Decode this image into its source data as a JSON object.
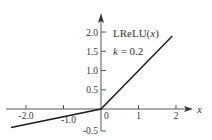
{
  "chart_data": {
    "type": "line",
    "title": "",
    "xlabel": "x",
    "ylabel": "",
    "annotations": [
      "LReLU(x)",
      "k = 0.2"
    ],
    "function": "LReLU(x) = x for x >= 0, k*x for x < 0",
    "k": 0.2,
    "x_ticks": [
      -2.0,
      -1.0,
      0,
      1,
      2
    ],
    "x_tick_labels": [
      "-2.0",
      "-1.0",
      "0",
      "1",
      "2"
    ],
    "y_ticks": [
      -0.5,
      0.5,
      1.0,
      1.5,
      2.0
    ],
    "y_tick_labels": [
      "-0.5",
      "0.5",
      "1.0",
      "1.5",
      "2.0"
    ],
    "xlim": [
      -2.4,
      2.4
    ],
    "ylim": [
      -0.6,
      2.3
    ],
    "grid": false,
    "legend": null,
    "series": [
      {
        "name": "LReLU(x)",
        "x": [
          -2.4,
          0,
          1.9
        ],
        "y": [
          -0.48,
          0,
          1.9
        ],
        "color": "#1a1a1a"
      }
    ]
  },
  "labels": {
    "function_name_prefix": "LReLU(",
    "function_name_var": "x",
    "function_name_suffix": ")",
    "param_var": "k",
    "param_eq": " = 0.2",
    "x_axis_name": "x"
  },
  "colors": {
    "axis": "#333333",
    "line": "#1a1a1a",
    "text": "#333333"
  }
}
